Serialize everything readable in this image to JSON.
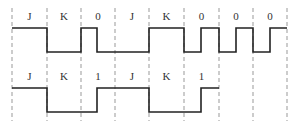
{
  "diagram": {
    "type": "timing-waveform",
    "dividers_x": [
      12,
      47,
      81,
      115,
      149,
      184,
      219,
      253,
      287
    ],
    "dash_y_range": [
      8,
      121
    ],
    "rows": [
      {
        "name": "row-1",
        "labels": [
          "J",
          "K",
          "0",
          "J",
          "K",
          "0",
          "0",
          "0"
        ],
        "label_y": 20,
        "high_y": 28,
        "low_y": 52,
        "path": "M12,28 L47,28 L47,52 L81,52 L81,28 L97,28 L97,52 L149,52 L149,28 L184,28 L184,52 L201,52 L201,28 L219,28 L219,52 L236,52 L236,28 L253,28 L253,52 L270,52 L270,28 L287,28"
      },
      {
        "name": "row-2",
        "labels": [
          "J",
          "K",
          "1",
          "J",
          "K",
          "1"
        ],
        "label_y": 80,
        "high_y": 88,
        "low_y": 112,
        "path": "M12,88 L47,88 L47,112 L97,112 L97,88 L149,88 L149,112 L201,112 L201,88 L219,88"
      }
    ]
  },
  "colors": {
    "line": "#222222",
    "divider": "#999999",
    "text": "#333333",
    "background": "#ffffff"
  }
}
